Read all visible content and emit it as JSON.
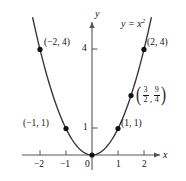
{
  "figure": {
    "equation_label": "y = x",
    "equation_exponent": "2",
    "axis_x_name": "x",
    "axis_y_name": "y"
  },
  "axes": {
    "x_ticks": [
      {
        "value": -2,
        "label": "−2"
      },
      {
        "value": -1,
        "label": "−1"
      },
      {
        "value": 1,
        "label": "1"
      },
      {
        "value": 2,
        "label": "2"
      }
    ],
    "y_ticks": [
      {
        "value": 1,
        "label": "1"
      },
      {
        "value": 4,
        "label": "4"
      }
    ],
    "origin_label": "0",
    "xlim": [
      -2.6,
      3.0
    ],
    "ylim": [
      -0.75,
      5.4
    ]
  },
  "points": [
    {
      "name": "point-neg2-4",
      "x": -2,
      "y": 4,
      "label": "(−2, 4)"
    },
    {
      "name": "point-neg1-1",
      "x": -1,
      "y": 1,
      "label": "(−1, 1)"
    },
    {
      "name": "point-origin",
      "x": 0,
      "y": 0,
      "label": ""
    },
    {
      "name": "point-1-1",
      "x": 1,
      "y": 1,
      "label": "(1, 1)"
    },
    {
      "name": "point-3over2-9over4",
      "x": 1.5,
      "y": 2.25,
      "label": "(3/2, 9/4)",
      "num1": "3",
      "den1": "2",
      "num2": "9",
      "den2": "4"
    },
    {
      "name": "point-2-4",
      "x": 2,
      "y": 4,
      "label": "(2, 4)"
    }
  ],
  "chart_data": {
    "type": "line",
    "xlabel": "x",
    "ylabel": "y",
    "xlim": [
      -2.6,
      3.0
    ],
    "ylim": [
      -0.75,
      5.4
    ],
    "grid": false,
    "legend": "none",
    "series": [
      {
        "name": "y = x^2",
        "x": [
          -2.25,
          -2.0,
          -1.75,
          -1.5,
          -1.25,
          -1.0,
          -0.75,
          -0.5,
          -0.25,
          0,
          0.25,
          0.5,
          0.75,
          1.0,
          1.25,
          1.5,
          1.75,
          2.0,
          2.15
        ],
        "y": [
          5.0625,
          4.0,
          3.0625,
          2.25,
          1.5625,
          1.0,
          0.5625,
          0.25,
          0.0625,
          0,
          0.0625,
          0.25,
          0.5625,
          1.0,
          1.5625,
          2.25,
          3.0625,
          4.0,
          4.6225
        ]
      }
    ],
    "annotated_points": [
      {
        "x": -2,
        "y": 4,
        "label": "(−2, 4)"
      },
      {
        "x": -1,
        "y": 1,
        "label": "(−1, 1)"
      },
      {
        "x": 0,
        "y": 0,
        "label": ""
      },
      {
        "x": 1,
        "y": 1,
        "label": "(1, 1)"
      },
      {
        "x": 1.5,
        "y": 2.25,
        "label": "(3/2, 9/4)"
      },
      {
        "x": 2,
        "y": 4,
        "label": "(2, 4)"
      }
    ],
    "xticks": [
      -2,
      -1,
      0,
      1,
      2
    ],
    "yticks": [
      1,
      4
    ]
  },
  "colors": {
    "curve": "#333333",
    "axis": "#555555",
    "point": "#111111",
    "text": "#111111",
    "background": "#ffffff"
  }
}
